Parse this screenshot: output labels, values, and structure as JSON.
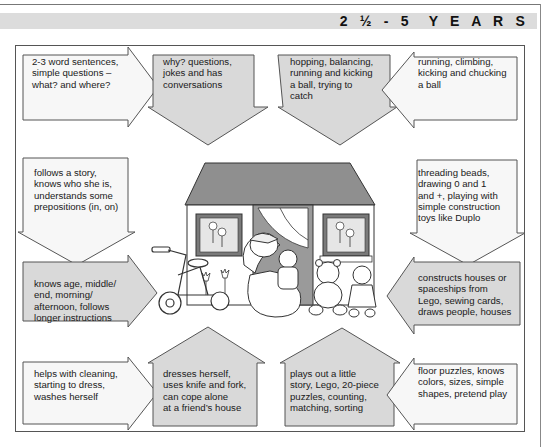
{
  "header": {
    "title": "2 ½ - 5  Y E A R S"
  },
  "colors": {
    "header_bar": "#dcdcdc",
    "arrow_gray": "#d9d9d9",
    "arrow_white": "#f7f7f7",
    "outline": "#555555",
    "roof": "#8f8f8f"
  },
  "steps": [
    {
      "id": "speech-1",
      "direction": "right",
      "shade": "white",
      "text": "2-3 word sentences,\nsimple questions –\nwhat? and where?"
    },
    {
      "id": "speech-2",
      "direction": "down",
      "shade": "gray",
      "text": "why? questions,\njokes and has\nconversations"
    },
    {
      "id": "motor-2",
      "direction": "down",
      "shade": "gray",
      "text": "hopping, balancing,\nrunning and kicking\na ball, trying to\ncatch"
    },
    {
      "id": "motor-1",
      "direction": "left",
      "shade": "white",
      "text": "running, climbing,\nkicking and chucking\na ball"
    },
    {
      "id": "understanding-1",
      "direction": "down",
      "shade": "white",
      "text": "follows a story,\nknows who she is,\nunderstands some\nprepositions (in, on)"
    },
    {
      "id": "fine-motor-1",
      "direction": "down",
      "shade": "white",
      "text": "threading beads,\ndrawing 0 and 1\nand +, playing with\nsimple construction\ntoys like Duplo"
    },
    {
      "id": "understanding-2",
      "direction": "right",
      "shade": "gray",
      "text": "knows age, middle/\nend, morning/\nafternoon, follows\nlonger instructions"
    },
    {
      "id": "fine-motor-2",
      "direction": "left",
      "shade": "gray",
      "text": "constructs houses or\nspaceships from\nLego, sewing cards,\ndraws people, houses"
    },
    {
      "id": "self-care-1",
      "direction": "right",
      "shade": "white",
      "text": "helps with cleaning,\nstarting to dress,\nwashes herself"
    },
    {
      "id": "self-care-2",
      "direction": "up",
      "shade": "gray",
      "text": "dresses herself,\nuses knife and fork,\ncan cope alone\nat a friend’s house"
    },
    {
      "id": "play-2",
      "direction": "up",
      "shade": "gray",
      "text": "plays out a little\nstory, Lego, 20-piece\npuzzles, counting,\nmatching, sorting"
    },
    {
      "id": "play-1",
      "direction": "left",
      "shade": "white",
      "text": "floor puzzles, knows\ncolors, sizes, simple\nshapes, pretend play"
    }
  ],
  "illustration": {
    "description": "child with teddy bear, tricycle, teddy bear and doll in front of a house with gray roof"
  }
}
